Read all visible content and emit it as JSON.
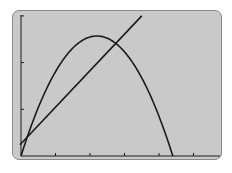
{
  "chart_data": {
    "type": "line",
    "title": "",
    "xlabel": "",
    "ylabel": "",
    "grid": false,
    "legend": "none",
    "xlim": [
      0,
      5.9
    ],
    "ylim": [
      0,
      3.0
    ],
    "x_tick_count": 6,
    "y_tick_count": 3,
    "series": [
      {
        "name": "parabola",
        "kind": "quadratic",
        "x": [
          0,
          0.5,
          1.0,
          1.5,
          2.0,
          2.1,
          2.5,
          3.0,
          3.5,
          4.0,
          4.4
        ],
        "y": [
          0,
          1.03,
          1.84,
          2.38,
          2.57,
          2.57,
          2.43,
          2.0,
          1.32,
          0.43,
          0
        ]
      },
      {
        "name": "line",
        "kind": "linear",
        "x": [
          0,
          2.7,
          3.5
        ],
        "y": [
          0.24,
          2.4,
          3.0
        ]
      }
    ],
    "annotations": [
      {
        "type": "intersection",
        "x": 0.3,
        "y": 0.5
      },
      {
        "type": "intersection",
        "x": 2.7,
        "y": 2.4
      }
    ]
  },
  "style": {
    "screen_bg": "#c9c9c9",
    "curve_color": "#1a1a1a",
    "axis_color": "#1a1a1a"
  }
}
